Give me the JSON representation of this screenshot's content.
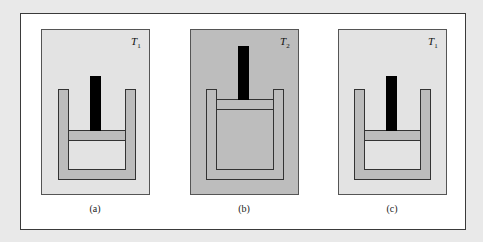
{
  "figure": {
    "panels": [
      {
        "id": "a",
        "caption": "(a)",
        "temp_symbol": "T",
        "temp_sub": "1",
        "bg": "#e3e3e3",
        "piston_position": "low"
      },
      {
        "id": "b",
        "caption": "(b)",
        "temp_symbol": "T",
        "temp_sub": "2",
        "bg": "#bdbdbd",
        "piston_position": "high"
      },
      {
        "id": "c",
        "caption": "(c)",
        "temp_symbol": "T",
        "temp_sub": "1",
        "bg": "#e3e3e3",
        "piston_position": "low"
      }
    ],
    "colors": {
      "cylinder_wall": "#bcbcbc",
      "gas_cold": "#e8e8e8",
      "gas_hot": "#bdbdbd",
      "piston": "#bcbcbc",
      "rod": "#000000",
      "outline": "#333333"
    }
  }
}
